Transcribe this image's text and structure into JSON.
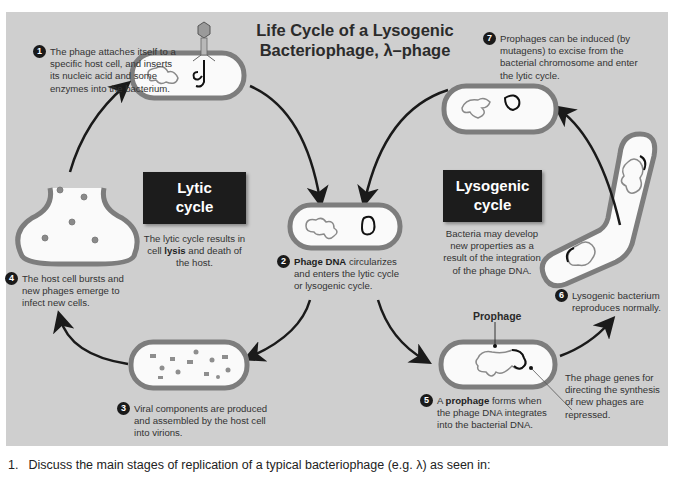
{
  "diagram": {
    "title_line1": "Life Cycle of a Lysogenic",
    "title_line2": "Bacteriophage, λ–phage",
    "lytic_box": {
      "line1": "Lytic",
      "line2": "cycle"
    },
    "lytic_desc": {
      "pre": "The lytic cycle results in cell ",
      "bold": "lysis",
      "post": " and death of the host."
    },
    "lysogenic_box": {
      "line1": "Lysogenic",
      "line2": "cycle"
    },
    "lysogenic_desc": "Bacteria may develop new properties as a result of the integration of the phage DNA.",
    "steps": [
      {
        "number": "1",
        "text": "The phage attaches itself to a specific host cell, and inserts its nucleic acid and some enzymes into the bacterium."
      },
      {
        "number": "2",
        "bold": "Phage DNA",
        "text": " circularizes and enters the lytic cycle or lysogenic cycle."
      },
      {
        "number": "3",
        "text": "Viral components are produced and assembled by the host cell into virions."
      },
      {
        "number": "4",
        "text": "The host cell bursts and new phages emerge to infect new cells."
      },
      {
        "number": "5",
        "pre": "A ",
        "bold": "prophage",
        "text": " forms when the phage DNA integrates into the bacterial DNA."
      },
      {
        "number": "6",
        "text": "Lysogenic bacterium reproduces normally."
      },
      {
        "number": "7",
        "text": "Prophages can be induced (by mutagens) to excise from the bacterial chromosome and enter the lytic cycle."
      }
    ],
    "labels": {
      "prophage": "Prophage",
      "phage_genes": "The phage genes for directing the synthesis of new phages are repressed."
    },
    "colors": {
      "panel_bg": "#cfcfcf",
      "cell_wall": "#7d7d7d",
      "cell_fill": "#fafafa",
      "dark_box": "#1c1c1c",
      "arrow": "#1a1a1a"
    }
  },
  "question": {
    "number": "1.",
    "text": "Discuss the main stages of replication of a typical bacteriophage (e.g. λ) as seen in:"
  }
}
